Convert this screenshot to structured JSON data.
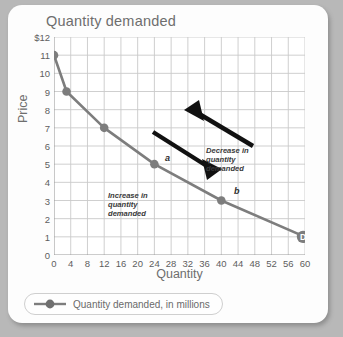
{
  "chart_data": {
    "type": "line",
    "title": "Quantity demanded",
    "xlabel": "Quantity",
    "ylabel": "Price",
    "xlim": [
      0,
      60
    ],
    "ylim": [
      0,
      12
    ],
    "grid": true,
    "x": [
      0,
      3,
      12,
      24,
      40,
      60
    ],
    "values": [
      11,
      9,
      7,
      5,
      3,
      1
    ],
    "series": [
      {
        "name": "Quantity demanded, in millions",
        "x": [
          0,
          3,
          12,
          24,
          40,
          60
        ],
        "values": [
          11,
          9,
          7,
          5,
          3,
          1
        ]
      }
    ],
    "xticks": [
      "0",
      "4",
      "8",
      "12",
      "16",
      "20",
      "24",
      "28",
      "32",
      "36",
      "40",
      "44",
      "48",
      "52",
      "56",
      "60"
    ],
    "xtick_values": [
      0,
      4,
      8,
      12,
      16,
      20,
      24,
      28,
      32,
      36,
      40,
      44,
      48,
      52,
      56,
      60
    ],
    "yticks": [
      "0",
      "1",
      "2",
      "3",
      "4",
      "5",
      "6",
      "7",
      "8",
      "9",
      "10",
      "11",
      "$12"
    ],
    "ytick_values": [
      0,
      1,
      2,
      3,
      4,
      5,
      6,
      7,
      8,
      9,
      10,
      11,
      12
    ],
    "legend": {
      "position": "bottom-left",
      "entries": [
        "Quantity demanded, in millions"
      ]
    },
    "point_labels": [
      {
        "label": "a",
        "x": 24,
        "y": 5
      },
      {
        "label": "b",
        "x": 40,
        "y": 3
      },
      {
        "label": "D",
        "x": 60,
        "y": 1
      }
    ],
    "annotations": [
      {
        "text": "Decrease in quantity demanded",
        "lines": [
          "Decrease in",
          "quantity",
          "demanded"
        ],
        "arrow": "up-left"
      },
      {
        "text": "Increase in quantity demanded",
        "lines": [
          "Increase in",
          "quantity",
          "demanded"
        ],
        "arrow": "down-right"
      }
    ],
    "colors": {
      "line": "#7d7d7d",
      "marker": "#7d7d7d",
      "grid": "#c9c9c9",
      "axis": "#9a9a9a",
      "text": "#5d5d5d",
      "arrow": "#1c1c1c",
      "card": "#fdfdfd",
      "background": "#b8b8b8"
    }
  }
}
